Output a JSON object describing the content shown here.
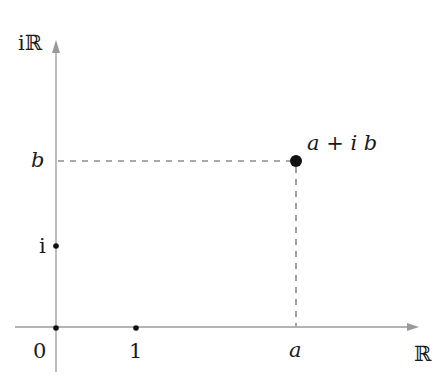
{
  "diagram": {
    "axes": {
      "x_label": "ℝ",
      "y_label": "iℝ",
      "color": "#9a9a9a"
    },
    "ticks": {
      "origin": "0",
      "one": "1",
      "i": "i",
      "a": "a",
      "b": "b"
    },
    "point": {
      "label": "a + i b",
      "color": "#111111"
    },
    "guide_color": "#555555"
  }
}
